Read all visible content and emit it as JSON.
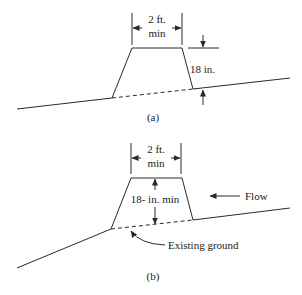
{
  "diagram_a": {
    "caption": "(a)",
    "width_label_line1": "2 ft.",
    "width_label_line2": "min",
    "height_label": "18 in."
  },
  "diagram_b": {
    "caption": "(b)",
    "width_label_line1": "2 ft.",
    "width_label_line2": "min",
    "height_label": "18- in. min",
    "flow_label": "Flow",
    "ground_label": "Existing ground"
  },
  "colors": {
    "line": "#2a2a2a",
    "background": "#ffffff"
  }
}
